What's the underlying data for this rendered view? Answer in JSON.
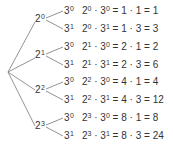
{
  "diagram": {
    "type": "tree",
    "root": {
      "x": 8,
      "y": 72
    },
    "level1": [
      {
        "base": "2",
        "exp": "0"
      },
      {
        "base": "2",
        "exp": "1"
      },
      {
        "base": "2",
        "exp": "2"
      },
      {
        "base": "2",
        "exp": "3"
      }
    ],
    "level2": [
      {
        "base": "3",
        "exp": "0"
      },
      {
        "base": "3",
        "exp": "1"
      }
    ],
    "rows": [
      {
        "a_exp": "0",
        "b_exp": "0",
        "rhs": " = 1 · 1 = 1"
      },
      {
        "a_exp": "0",
        "b_exp": "1",
        "rhs": " = 1 · 3 = 3"
      },
      {
        "a_exp": "1",
        "b_exp": "0",
        "rhs": " = 2 · 1 = 2"
      },
      {
        "a_exp": "1",
        "b_exp": "1",
        "rhs": " = 2 · 3 = 6"
      },
      {
        "a_exp": "2",
        "b_exp": "0",
        "rhs": " = 4 · 1 = 4"
      },
      {
        "a_exp": "2",
        "b_exp": "1",
        "rhs": " = 4 · 3 = 12"
      },
      {
        "a_exp": "3",
        "b_exp": "0",
        "rhs": " = 8 · 1 = 8"
      },
      {
        "a_exp": "3",
        "b_exp": "1",
        "rhs": " = 8 · 3 = 24"
      }
    ],
    "dot": " · ",
    "base_a": "2",
    "base_b": "3",
    "line_color": "#777777",
    "text_color": "#333333"
  }
}
